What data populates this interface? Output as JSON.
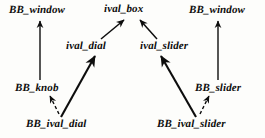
{
  "diagram": {
    "kind": "class-inheritance-graph",
    "style": {
      "background": "#fdfdfb",
      "ink": "#0d0d0d",
      "font_style": "bold-italic-serif"
    },
    "nodes": [
      {
        "id": "bb_window_left",
        "label": "BB_window",
        "row": 1,
        "x": 9,
        "y": 4
      },
      {
        "id": "ival_box",
        "label": "ival_box",
        "row": 1,
        "x": 104,
        "y": 3
      },
      {
        "id": "bb_window_right",
        "label": "BB_window",
        "row": 1,
        "x": 189,
        "y": 4
      },
      {
        "id": "ival_dial",
        "label": "ival_dial",
        "row": 2,
        "x": 66,
        "y": 40
      },
      {
        "id": "ival_slider",
        "label": "ival_slider",
        "row": 2,
        "x": 140,
        "y": 40
      },
      {
        "id": "bb_knob",
        "label": "BB_knob",
        "row": 3,
        "x": 15,
        "y": 82
      },
      {
        "id": "bb_slider",
        "label": "BB_slider",
        "row": 3,
        "x": 195,
        "y": 82
      },
      {
        "id": "bb_ival_dial",
        "label": "BB_ival_dial",
        "row": 4,
        "x": 26,
        "y": 118
      },
      {
        "id": "bb_ival_slider",
        "label": "BB_ival_slider",
        "row": 4,
        "x": 157,
        "y": 118
      }
    ],
    "edges": [
      {
        "id": "e1",
        "from": "bb_knob",
        "to": "bb_window_left",
        "line": "solid",
        "arrow": "open"
      },
      {
        "id": "e2",
        "from": "bb_slider",
        "to": "bb_window_right",
        "line": "solid",
        "arrow": "open"
      },
      {
        "id": "e3",
        "from": "ival_dial",
        "to": "ival_box",
        "line": "solid",
        "arrow": "open"
      },
      {
        "id": "e4",
        "from": "ival_slider",
        "to": "ival_box",
        "line": "solid",
        "arrow": "open"
      },
      {
        "id": "e5",
        "from": "bb_ival_dial",
        "to": "ival_dial",
        "line": "solid",
        "arrow": "open"
      },
      {
        "id": "e6",
        "from": "bb_ival_slider",
        "to": "ival_slider",
        "line": "solid",
        "arrow": "open"
      },
      {
        "id": "e7",
        "from": "bb_ival_dial",
        "to": "bb_knob",
        "line": "dashed",
        "arrow": "open"
      },
      {
        "id": "e8",
        "from": "bb_ival_slider",
        "to": "bb_slider",
        "line": "dashed",
        "arrow": "open"
      }
    ]
  }
}
